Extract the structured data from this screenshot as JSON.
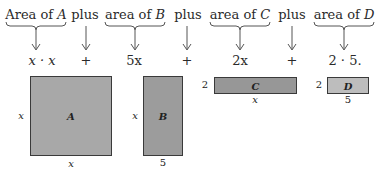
{
  "header": {
    "terms": [
      {
        "prefix": "Area of ",
        "var": "A",
        "x": 36
      },
      {
        "prefix": "plus",
        "var": "",
        "x": 85
      },
      {
        "prefix": "area of ",
        "var": "B",
        "x": 135
      },
      {
        "prefix": "plus",
        "var": "",
        "x": 188
      },
      {
        "prefix": "area of ",
        "var": "C",
        "x": 240
      },
      {
        "prefix": "plus",
        "var": "",
        "x": 292
      },
      {
        "prefix": "area of ",
        "var": "D",
        "x": 344
      }
    ]
  },
  "expressions": [
    {
      "text": "x · x",
      "x": 42
    },
    {
      "text": "+",
      "x": 86
    },
    {
      "text": "5x",
      "x": 134
    },
    {
      "text": "+",
      "x": 187
    },
    {
      "text": "2x",
      "x": 240
    },
    {
      "text": "+",
      "x": 292
    },
    {
      "text": "2 · 5.",
      "x": 345
    }
  ],
  "rectangles": [
    {
      "name": "A",
      "left_label": "x",
      "bottom_label": "x",
      "fill": "#a8a8a8"
    },
    {
      "name": "B",
      "left_label": "x",
      "bottom_label": "5",
      "fill": "#9c9c9c"
    },
    {
      "name": "C",
      "left_label": "2",
      "bottom_label": "x",
      "fill": "#979797"
    },
    {
      "name": "D",
      "left_label": "2",
      "bottom_label": "5",
      "fill": "#bdbdbd"
    }
  ]
}
